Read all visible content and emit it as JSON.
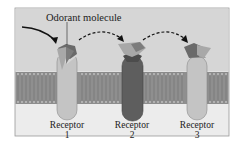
{
  "diagram": {
    "callout": "Odorant molecule",
    "receptors": [
      {
        "label": "Receptor",
        "number": "1",
        "state": "binding"
      },
      {
        "label": "Receptor",
        "number": "2",
        "state": "bound"
      },
      {
        "label": "Receptor",
        "number": "3",
        "state": "binding"
      }
    ],
    "colors": {
      "extracellular": "#d6d6d6",
      "intracellular": "#ececec",
      "membrane": "#8f8f8f",
      "lipid_head": "#b5b5b5",
      "receptor_light": "#c4c4c4",
      "receptor_dark": "#5e5e5e",
      "odorant_dark": "#6a6a6a",
      "odorant_light": "#a8a8a8",
      "arrow": "#111111"
    }
  }
}
